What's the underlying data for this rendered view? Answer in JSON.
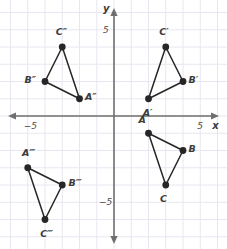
{
  "figure": {
    "kind": "coordinate-plane-triangles",
    "background_color": "#ffffff",
    "grid_color": "#e8e6f0",
    "axis_color": "#6f6f6f",
    "shape_color": "#262626",
    "label_color": "#3b3b3b"
  },
  "axes": {
    "x_label": "x",
    "y_label": "y",
    "x_ticks": [
      {
        "label": "−5",
        "value": -5
      },
      {
        "label": "5",
        "value": 5
      }
    ],
    "y_ticks": [
      {
        "label": "5",
        "value": 5
      },
      {
        "label": "−5",
        "value": -5
      }
    ],
    "xlim": [
      -6.5,
      6.4
    ],
    "ylim": [
      -7.5,
      6.5
    ],
    "grid": true,
    "grid_step": 1
  },
  "chart_data": {
    "type": "scatter",
    "title": "",
    "xlabel": "x",
    "ylabel": "y",
    "xlim": [
      -6.5,
      6.4
    ],
    "ylim": [
      -7.5,
      6.5
    ],
    "grid": true,
    "legend": "none",
    "series": [
      {
        "name": "Triangle ABC",
        "closed": true,
        "points": [
          {
            "label": "A",
            "x": 2,
            "y": -1,
            "label_dx": -0.35,
            "label_dy": 0.75
          },
          {
            "label": "B",
            "x": 4,
            "y": -2,
            "label_dx": 0.55,
            "label_dy": 0.1
          },
          {
            "label": "C",
            "x": 3,
            "y": -4,
            "label_dx": -0.1,
            "label_dy": -0.8
          }
        ]
      },
      {
        "name": "Triangle A'B'C'",
        "closed": true,
        "points": [
          {
            "label": "A′",
            "x": 2,
            "y": 1,
            "label_dx": -0.1,
            "label_dy": -0.85
          },
          {
            "label": "B′",
            "x": 4,
            "y": 2,
            "label_dx": 0.55,
            "label_dy": 0.1
          },
          {
            "label": "C′",
            "x": 3,
            "y": 4,
            "label_dx": -0.15,
            "label_dy": 0.85
          }
        ]
      },
      {
        "name": "Triangle A''B''C''",
        "closed": true,
        "points": [
          {
            "label": "A″",
            "x": -2,
            "y": 1,
            "label_dx": 0.55,
            "label_dy": 0.1
          },
          {
            "label": "B″",
            "x": -4,
            "y": 2,
            "label_dx": -0.95,
            "label_dy": 0.1
          },
          {
            "label": "C″",
            "x": -3,
            "y": 4,
            "label_dx": -0.15,
            "label_dy": 0.85
          }
        ]
      },
      {
        "name": "Triangle A'''B'''C'''",
        "closed": true,
        "points": [
          {
            "label": "A‴",
            "x": -5,
            "y": -3,
            "label_dx": -0.1,
            "label_dy": 0.85
          },
          {
            "label": "B‴",
            "x": -3,
            "y": -4,
            "label_dx": 0.6,
            "label_dy": 0.1
          },
          {
            "label": "C‴",
            "x": -4,
            "y": -6,
            "label_dx": -0.05,
            "label_dy": -0.85
          }
        ]
      }
    ]
  }
}
